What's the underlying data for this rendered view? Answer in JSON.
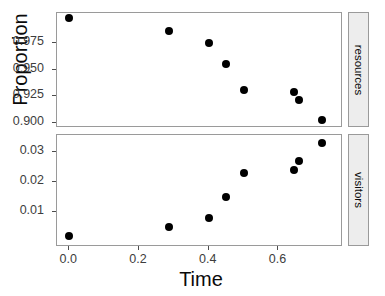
{
  "chart_data": {
    "type": "scatter",
    "title": "",
    "xlabel": "Time",
    "ylabel": "Proportion",
    "xlim": [
      -0.035,
      0.785
    ],
    "xticks": [
      0.0,
      0.2,
      0.4,
      0.6
    ],
    "xticklabels": [
      "0.0",
      "0.2",
      "0.4",
      "0.6"
    ],
    "grid": false,
    "legend": "none",
    "facet": {
      "position": "right",
      "direction": "vertical",
      "labels": [
        "resources",
        "visitors"
      ]
    },
    "x": [
      0.0,
      0.285,
      0.4,
      0.45,
      0.5,
      0.645,
      0.66,
      0.725
    ],
    "panels": [
      {
        "name": "resources",
        "strip_label": "resources",
        "ylim": [
          0.8955,
          1.003
        ],
        "yticks": [
          0.9,
          0.925,
          0.95,
          0.975
        ],
        "yticklabels": [
          "0.900",
          "0.925",
          "0.950",
          "0.975"
        ],
        "values": [
          0.998,
          0.986,
          0.975,
          0.955,
          0.931,
          0.929,
          0.922,
          0.903
        ]
      },
      {
        "name": "visitors",
        "strip_label": "visitors",
        "ylim": [
          -0.0015,
          0.0355
        ],
        "yticks": [
          0.01,
          0.02,
          0.03
        ],
        "yticklabels": [
          "0.01",
          "0.02",
          "0.03"
        ],
        "values": [
          0.002,
          0.005,
          0.008,
          0.015,
          0.023,
          0.024,
          0.027,
          0.033
        ]
      }
    ]
  }
}
